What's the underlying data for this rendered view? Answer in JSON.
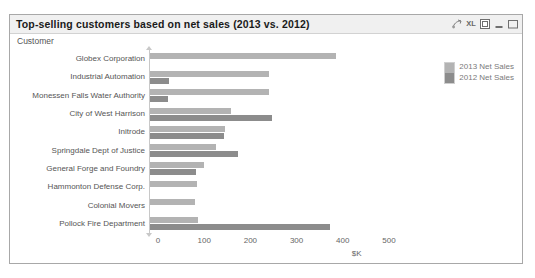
{
  "window": {
    "title": "Top-selling customers based on net sales (2013 vs. 2012)",
    "icons": [
      {
        "name": "export-arrow-icon",
        "glyph": "↗"
      },
      {
        "name": "excel-xl-icon",
        "glyph": "XL"
      },
      {
        "name": "fullscreen-icon",
        "glyph": "⧉"
      },
      {
        "name": "minimize-icon",
        "glyph": "–"
      },
      {
        "name": "maximize-icon",
        "glyph": "□"
      }
    ]
  },
  "dimension_label": "Customer",
  "legend": {
    "items": [
      {
        "label": "2013 Net Sales",
        "color": "#b3b3b3"
      },
      {
        "label": "2012 Net Sales",
        "color": "#8c8c8c"
      }
    ]
  },
  "chart_data": {
    "type": "bar",
    "orientation": "horizontal",
    "title": "Top-selling customers based on net sales (2013 vs. 2012)",
    "xlabel": "$K",
    "ylabel": "Customer",
    "xlim": [
      0,
      560
    ],
    "xticks": [
      0,
      100,
      200,
      300,
      400,
      500
    ],
    "grid": false,
    "legend_position": "top-right",
    "categories": [
      "Globex Corporation",
      "Industrial Automation",
      "Monessen Falls Water Authority",
      "City of West Harrison",
      "Initrode",
      "Springdale Dept of Justice",
      "General Forge and Foundry",
      "Hammonton Defense Corp.",
      "Colonial Movers",
      "Pollock Fire Department"
    ],
    "series": [
      {
        "name": "2013 Net Sales",
        "color": "#b3b3b3",
        "values": [
          402,
          258,
          257,
          175,
          163,
          143,
          117,
          102,
          98,
          103
        ]
      },
      {
        "name": "2012 Net Sales",
        "color": "#8c8c8c",
        "values": [
          0,
          42,
          40,
          264,
          161,
          190,
          99,
          0,
          0,
          389
        ]
      }
    ]
  }
}
